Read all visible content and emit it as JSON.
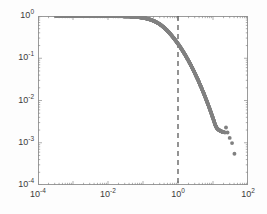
{
  "chart_data": {
    "type": "scatter",
    "title": "",
    "subtitle": "",
    "xlabel": "",
    "ylabel": "",
    "xscale": "log",
    "yscale": "log",
    "xlim": [
      0.0001,
      100
    ],
    "ylim": [
      0.0001,
      1
    ],
    "grid": false,
    "legend": null,
    "marker": {
      "shape": "circle",
      "color": "#808080",
      "size": 3
    },
    "annotations": [
      {
        "name": "threshold-line",
        "type": "vline",
        "x": 1,
        "style": "dashed",
        "color": "#4d4d4d"
      }
    ],
    "x_ticks": [
      {
        "value": 0.0001,
        "label": "10",
        "exponent": "-4"
      },
      {
        "value": 0.01,
        "label": "10",
        "exponent": "-2"
      },
      {
        "value": 1,
        "label": "10",
        "exponent": "0"
      },
      {
        "value": 100,
        "label": "10",
        "exponent": "2"
      }
    ],
    "y_ticks": [
      {
        "value": 1,
        "label": "10",
        "exponent": "0"
      },
      {
        "value": 0.1,
        "label": "10",
        "exponent": "-1"
      },
      {
        "value": 0.01,
        "label": "10",
        "exponent": "-2"
      },
      {
        "value": 0.001,
        "label": "10",
        "exponent": "-3"
      },
      {
        "value": 0.0001,
        "label": "10",
        "exponent": "-4"
      }
    ],
    "series": [
      {
        "name": "ccdf",
        "x": [
          0.00032,
          0.00048,
          0.0007,
          0.00095,
          0.00125,
          0.0016,
          0.0021,
          0.0027,
          0.0034,
          0.0042,
          0.0051,
          0.0062,
          0.0074,
          0.0088,
          0.0104,
          0.0122,
          0.0142,
          0.0165,
          0.0191,
          0.022,
          0.0253,
          0.029,
          0.0332,
          0.0379,
          0.0432,
          0.0492,
          0.0559,
          0.0634,
          0.0718,
          0.0812,
          0.0918,
          0.1037,
          0.117,
          0.132,
          0.1487,
          0.1675,
          0.1886,
          0.2122,
          0.2387,
          0.2684,
          0.3017,
          0.339,
          0.3808,
          0.4276,
          0.48,
          0.5386,
          0.6042,
          0.6776,
          0.7597,
          0.8514,
          0.9539,
          1.0682,
          1.1957,
          1.3377,
          1.4957,
          1.6712,
          1.8659,
          2.0817,
          2.3205,
          2.5846,
          2.8762,
          3.1979,
          3.5523,
          3.9423,
          4.371,
          4.8416,
          5.3576,
          5.9228,
          6.5411,
          7.2168,
          7.9544,
          8.7588,
          9.635,
          10.589,
          11.627,
          12.757,
          13.986,
          15.323,
          16.777,
          18.359,
          20.079,
          21.95,
          23.5,
          26.0,
          30.0,
          35.0,
          41.0
        ],
        "y": [
          0.999,
          0.999,
          0.998,
          0.998,
          0.997,
          0.997,
          0.996,
          0.996,
          0.995,
          0.995,
          0.994,
          0.994,
          0.993,
          0.992,
          0.991,
          0.99,
          0.989,
          0.988,
          0.986,
          0.984,
          0.982,
          0.979,
          0.976,
          0.972,
          0.967,
          0.962,
          0.955,
          0.947,
          0.938,
          0.927,
          0.914,
          0.899,
          0.882,
          0.862,
          0.839,
          0.813,
          0.784,
          0.752,
          0.716,
          0.678,
          0.637,
          0.594,
          0.55,
          0.505,
          0.461,
          0.417,
          0.375,
          0.335,
          0.298,
          0.263,
          0.232,
          0.203,
          0.177,
          0.153,
          0.132,
          0.113,
          0.0963,
          0.0816,
          0.0689,
          0.0578,
          0.0484,
          0.0403,
          0.0334,
          0.0276,
          0.0227,
          0.0186,
          0.0152,
          0.0124,
          0.01,
          0.00808,
          0.0065,
          0.00521,
          0.00416,
          0.00331,
          0.00262,
          0.00224,
          0.00207,
          0.00196,
          0.00188,
          0.00182,
          0.00178,
          0.00175,
          0.0023,
          0.00175,
          0.0013,
          0.00098,
          0.00055
        ]
      }
    ]
  }
}
